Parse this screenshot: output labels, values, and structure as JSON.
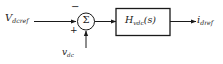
{
  "diagram": {
    "type": "control-block-diagram",
    "stroke_color": "#1a1a1a",
    "background_color": "#ffffff",
    "input_reference": {
      "symbol": "V",
      "subscript": "dcref",
      "full": "V_dcref"
    },
    "feedback_input": {
      "symbol": "v",
      "subscript": "dc",
      "full": "v_dc"
    },
    "output": {
      "symbol": "i",
      "subscript": "dref",
      "full": "i_dref"
    },
    "summing_junction": {
      "glyph": "Σ",
      "sign_top": "−",
      "sign_bottom": "+"
    },
    "transfer_block": {
      "symbol": "H",
      "subscript": "vdc",
      "argument": "(s)",
      "full": "H_vdc(s)"
    }
  }
}
